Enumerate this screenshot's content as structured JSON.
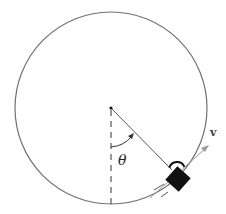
{
  "diagram": {
    "type": "circular-motion-pendulum",
    "labels": {
      "angle": "θ",
      "velocity": "v"
    },
    "colors": {
      "circle": "#707070",
      "string": "#555555",
      "mass": "#111111",
      "velocity_arrow": "#9a9a9a",
      "dashed_line": "#333333"
    },
    "geometry": {
      "center": [
        111,
        108
      ],
      "radius": 96,
      "mass_position": [
        177,
        178
      ],
      "string_angle_deg": 45
    }
  }
}
